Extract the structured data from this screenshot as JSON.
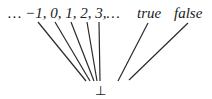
{
  "diagram": {
    "type": "hasse-diagram",
    "top_row": {
      "integers_label": "… −1, 0, 1, 2, 3,…",
      "true_label": "true",
      "false_label": "false"
    },
    "bottom_label": "⊥",
    "nodes": [
      "…",
      "-1",
      "0",
      "1",
      "2",
      "3",
      "…",
      "true",
      "false",
      "⊥"
    ],
    "edges": [
      {
        "from": "-1",
        "to": "⊥"
      },
      {
        "from": "0",
        "to": "⊥"
      },
      {
        "from": "1",
        "to": "⊥"
      },
      {
        "from": "2",
        "to": "⊥"
      },
      {
        "from": "3",
        "to": "⊥"
      },
      {
        "from": "true",
        "to": "⊥"
      },
      {
        "from": "false",
        "to": "⊥"
      }
    ],
    "colors": {
      "ink": "#1a1a1a",
      "background": "#ffffff"
    }
  }
}
